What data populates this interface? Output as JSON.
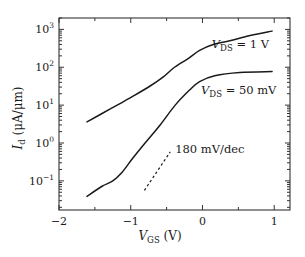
{
  "chart_data": {
    "type": "line",
    "title": "",
    "xlabel": {
      "main": "V",
      "sub": "GS",
      "unit": " (V)"
    },
    "ylabel": {
      "main": "I",
      "sub": "d",
      "unit": " (μA/μm)"
    },
    "xlim": [
      -2,
      1.22
    ],
    "ylim": [
      0.017,
      2000
    ],
    "yscale": "log",
    "x_ticks": [
      -2,
      -1,
      0,
      1
    ],
    "x_tick_labels": [
      "−2",
      "−1",
      "0",
      "1"
    ],
    "x_minor_ticks": [
      -1.5,
      -0.5,
      0.5
    ],
    "y_ticks": [
      0.1,
      1,
      10,
      100,
      1000
    ],
    "y_tick_labels": [
      {
        "base": "10",
        "exp": "−1"
      },
      {
        "base": "10",
        "exp": "0"
      },
      {
        "base": "10",
        "exp": "1"
      },
      {
        "base": "10",
        "exp": "2"
      },
      {
        "base": "10",
        "exp": "3"
      }
    ],
    "grid": false,
    "series": [
      {
        "name": "VDS = 1 V",
        "x": [
          -1.61,
          -1.4,
          -1.15,
          -0.95,
          -0.73,
          -0.55,
          -0.39,
          -0.2,
          -0.04,
          0.15,
          0.38,
          0.65,
          0.97
        ],
        "y": [
          3.6,
          6.0,
          11,
          18,
          32,
          55,
          100,
          170,
          280,
          400,
          500,
          680,
          900
        ]
      },
      {
        "name": "VDS = 50 mV",
        "x": [
          -1.61,
          -1.4,
          -1.25,
          -1.12,
          -0.97,
          -0.8,
          -0.59,
          -0.38,
          -0.18,
          -0.04,
          0.17,
          0.52,
          0.97
        ],
        "y": [
          0.039,
          0.072,
          0.1,
          0.17,
          0.4,
          1.0,
          3.0,
          10,
          25,
          42,
          60,
          73,
          77
        ]
      }
    ],
    "guide_line": {
      "style": "dashed",
      "x": [
        -0.81,
        -0.45
      ],
      "y": [
        0.056,
        0.58
      ],
      "label": "180 mV/dec"
    },
    "annotations": [
      {
        "main": "V",
        "sub": "DS",
        "rest": " = 1 V",
        "at": [
          0.13,
          330
        ]
      },
      {
        "main": "V",
        "sub": "DS",
        "rest": " = 50 mV",
        "at": [
          -0.02,
          20
        ]
      },
      {
        "text": "180 mV/dec",
        "at": [
          -0.38,
          0.55
        ]
      }
    ],
    "colors": {
      "line": "#1a1a1a",
      "axis": "#333333"
    }
  }
}
